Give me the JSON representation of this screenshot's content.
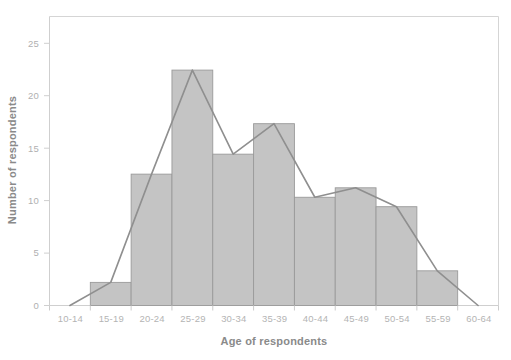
{
  "chart_data": {
    "type": "bar",
    "title": "",
    "subtitle": "",
    "xlabel": "Age of respondents",
    "ylabel": "Number of respondents",
    "categories": [
      "10-14",
      "15-19",
      "20-24",
      "25-29",
      "30-34",
      "35-39",
      "40-44",
      "45-49",
      "50-54",
      "55-59",
      "60-64"
    ],
    "values": [
      0,
      2.2,
      12.5,
      22.4,
      14.4,
      17.3,
      10.3,
      11.2,
      9.4,
      3.3,
      0
    ],
    "series": [
      {
        "name": "Histogram bars",
        "type": "bar",
        "values": [
          0,
          2.2,
          12.5,
          22.4,
          14.4,
          17.3,
          10.3,
          11.2,
          9.4,
          3.3,
          0
        ]
      },
      {
        "name": "Frequency polygon",
        "type": "line",
        "values": [
          0,
          2.2,
          12.5,
          22.4,
          14.4,
          17.3,
          10.3,
          11.2,
          9.4,
          3.3,
          0
        ]
      }
    ],
    "xlim": [
      0,
      11
    ],
    "ylim": [
      0,
      27.5
    ],
    "yticks": [
      0,
      5,
      10,
      15,
      20,
      25
    ],
    "ytick_labels": [
      "0",
      "5",
      "10",
      "15",
      "20",
      "25"
    ],
    "xtick_labels": [
      "10-14",
      "15-19",
      "20-24",
      "25-29",
      "30-34",
      "35-39",
      "40-44",
      "45-49",
      "50-54",
      "55-59",
      "60-64"
    ],
    "grid": false,
    "legend": "none",
    "bar_fill_color": "#c4c4c4",
    "bar_edge_color": "#9a9a9a",
    "line_color": "#8f8f8f",
    "axis_color": "#cccccc",
    "tick_label_color": "#b0b0b0",
    "axis_title_color": "#8a8a8a",
    "background_color": "#ffffff"
  }
}
